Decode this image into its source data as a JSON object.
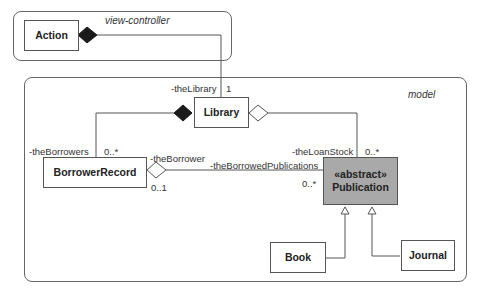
{
  "packages": {
    "view_controller": {
      "label": "view-controller"
    },
    "model": {
      "label": "model"
    }
  },
  "classes": {
    "action": {
      "name": "Action"
    },
    "library": {
      "name": "Library"
    },
    "borrower_record": {
      "name": "BorrowerRecord"
    },
    "publication": {
      "stereotype": "«abstract»",
      "name": "Publication"
    },
    "book": {
      "name": "Book"
    },
    "journal": {
      "name": "Journal"
    }
  },
  "roles": {
    "the_library": "-theLibrary",
    "the_library_mult": "1",
    "the_borrowers": "-theBorrowers",
    "the_borrowers_mult": "0..*",
    "the_borrower": "-theBorrower",
    "the_borrower_mult": "0..1",
    "the_borrowed_publications": "-theBorrowedPublications",
    "the_borrowed_publications_mult": "0..*",
    "the_loan_stock": "-theLoanStock",
    "the_loan_stock_mult": "0..*"
  },
  "colors": {
    "line": "#555555",
    "abstract_fill": "#a9a9a9",
    "composition_fill": "#1a1a1a"
  }
}
